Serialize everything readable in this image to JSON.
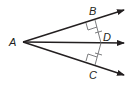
{
  "diagram": {
    "type": "angle-bisector",
    "points": {
      "A": {
        "label": "A",
        "x": 23,
        "y": 42
      },
      "B": {
        "label": "B",
        "x": 95,
        "y": 20
      },
      "C": {
        "label": "C",
        "x": 95,
        "y": 65
      },
      "D": {
        "label": "D",
        "x": 101,
        "y": 43
      }
    },
    "rays": [
      {
        "name": "ray-AB",
        "from": "A",
        "to": [
          124,
          10
        ]
      },
      {
        "name": "ray-AD",
        "from": "A",
        "to": [
          124,
          43
        ]
      },
      {
        "name": "ray-AC",
        "from": "A",
        "to": [
          124,
          75
        ]
      }
    ],
    "segments": [
      {
        "name": "segment-DB",
        "from": "D",
        "to": "B",
        "tick_marks": 1
      },
      {
        "name": "segment-DC",
        "from": "D",
        "to": "C",
        "tick_marks": 1
      }
    ],
    "right_angles": [
      "B",
      "C"
    ],
    "colors": {
      "stroke": "#231f20",
      "aux": "#6d6e71"
    }
  }
}
